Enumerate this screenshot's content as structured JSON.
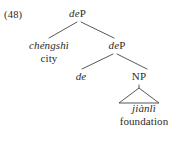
{
  "figure": {
    "example_number": "(48)",
    "background_color": "#ffffff",
    "ink_color": "#2b2b2b"
  },
  "tree": {
    "root": {
      "label_italic": "de",
      "label_roman": "P",
      "full_label": "deP"
    },
    "specifier": {
      "word": "chéngshì",
      "gloss": "city"
    },
    "intermediate": {
      "label_italic": "de",
      "label_roman": "P",
      "full_label": "deP"
    },
    "head": {
      "label_italic": "de",
      "full_label": "de"
    },
    "np": {
      "label_roman": "NP",
      "full_label": "NP"
    },
    "terminal": {
      "word": "jiànlì",
      "gloss": "foundation",
      "triangle": "triangle-adjunct"
    }
  }
}
